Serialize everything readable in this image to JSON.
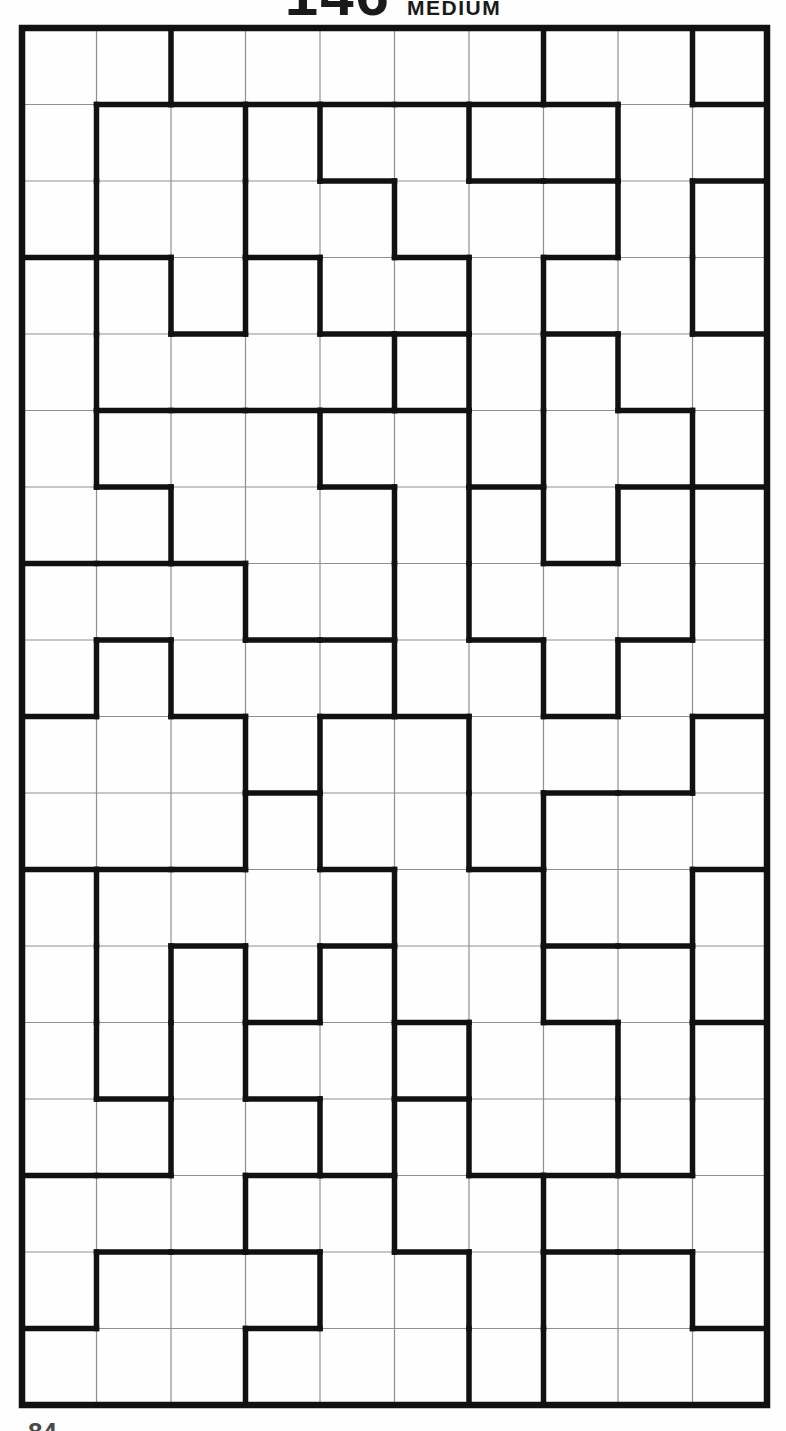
{
  "title": {
    "number": "146",
    "difficulty": "MEDIUM"
  },
  "page_number": "84",
  "grid": {
    "cols": 10,
    "rows": 18,
    "left": 22,
    "top": 28,
    "right": 767,
    "bottom": 1405,
    "background": "#fefefe",
    "thin_color": "#8f8f8f",
    "thin_width": 1.2,
    "thick_color": "#111111",
    "thick_width": 5.5,
    "border_width": 6.5,
    "v_edges": [
      [
        2,
        7,
        9
      ],
      [
        1,
        3,
        4,
        6,
        8
      ],
      [
        1,
        3,
        5,
        8,
        9
      ],
      [
        1,
        2,
        3,
        4,
        6,
        7,
        9
      ],
      [
        1,
        5,
        6,
        7,
        8
      ],
      [
        1,
        4,
        6,
        7,
        9
      ],
      [
        2,
        5,
        6,
        7,
        8,
        9
      ],
      [
        3,
        5,
        6,
        9
      ],
      [
        1,
        2,
        5,
        7,
        8
      ],
      [
        3,
        4,
        6,
        9
      ],
      [
        3,
        4,
        6,
        7
      ],
      [
        1,
        5,
        7,
        9
      ],
      [
        1,
        2,
        3,
        4,
        5,
        7,
        9
      ],
      [
        1,
        2,
        3,
        5,
        6,
        8,
        9
      ],
      [
        2,
        4,
        5,
        6,
        8,
        9
      ],
      [
        3,
        5,
        7
      ],
      [
        1,
        4,
        6,
        7,
        9
      ],
      [
        3,
        6,
        7
      ]
    ],
    "h_edges": [
      [
        1,
        2,
        3,
        4,
        5,
        6,
        7,
        9
      ],
      [
        4,
        6,
        7,
        9
      ],
      [
        0,
        1,
        3,
        5,
        7
      ],
      [
        2,
        4,
        5,
        7,
        9
      ],
      [
        1,
        2,
        3,
        4,
        5,
        8
      ],
      [
        1,
        4,
        6,
        8,
        9
      ],
      [
        0,
        1,
        2,
        7
      ],
      [
        1,
        3,
        4,
        6,
        8
      ],
      [
        0,
        2,
        4,
        5,
        7,
        9
      ],
      [
        3,
        7,
        8
      ],
      [
        0,
        1,
        2,
        4,
        6,
        9
      ],
      [
        2,
        4,
        7,
        8
      ],
      [
        3,
        5,
        7,
        9
      ],
      [
        1,
        3,
        5
      ],
      [
        0,
        1,
        3,
        4,
        6,
        7,
        8
      ],
      [
        1,
        2,
        3,
        5,
        7,
        8
      ],
      [
        0,
        3,
        9
      ]
    ]
  }
}
